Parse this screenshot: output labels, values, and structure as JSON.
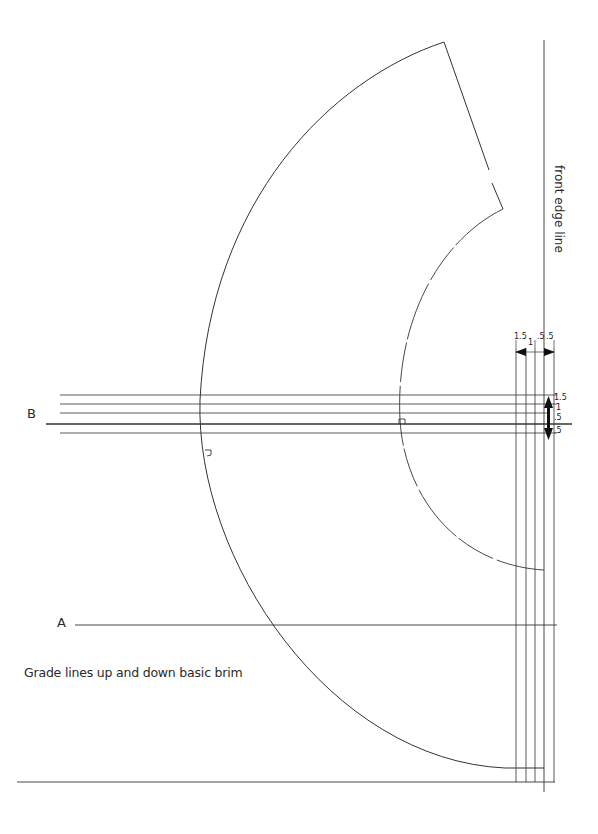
{
  "labels": {
    "front_edge": "front edge line",
    "line_a": "A",
    "line_b": "B",
    "caption": "Grade lines up and down basic brim"
  },
  "horizontal_dims": [
    "1.5",
    "1",
    ".5",
    ".5"
  ],
  "vertical_dims": [
    "1.5",
    "1",
    ".5",
    ".5"
  ],
  "colors": {
    "line": "#333333",
    "background": "#ffffff"
  }
}
